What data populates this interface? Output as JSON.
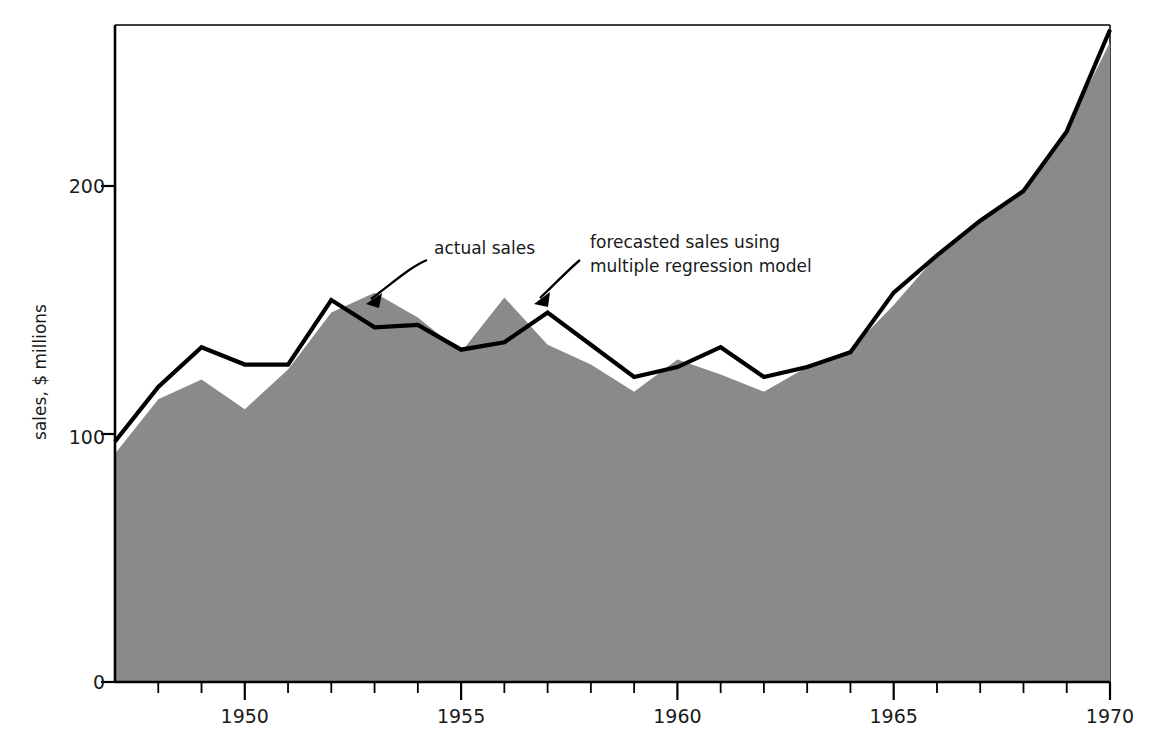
{
  "chart_data": {
    "type": "area",
    "title": "",
    "xlabel": "",
    "ylabel": "sales, $ millions",
    "xlim": [
      1947,
      1970
    ],
    "ylim": [
      0,
      265
    ],
    "grid": false,
    "legend_position": "annotations-inline",
    "x": [
      1947,
      1948,
      1949,
      1950,
      1951,
      1952,
      1953,
      1954,
      1955,
      1956,
      1957,
      1958,
      1959,
      1960,
      1961,
      1962,
      1963,
      1964,
      1965,
      1966,
      1967,
      1968,
      1969,
      1970
    ],
    "xticks": [
      1947,
      1948,
      1949,
      1950,
      1951,
      1952,
      1953,
      1954,
      1955,
      1956,
      1957,
      1958,
      1959,
      1960,
      1961,
      1962,
      1963,
      1964,
      1965,
      1966,
      1967,
      1968,
      1969,
      1970
    ],
    "xtick_labels": [
      "",
      "",
      "",
      "1950",
      "",
      "",
      "",
      "",
      "1955",
      "",
      "",
      "",
      "",
      "1960",
      "",
      "",
      "",
      "",
      "1965",
      "",
      "",
      "",
      "",
      "1970"
    ],
    "yticks": [
      0,
      100,
      200
    ],
    "ytick_labels": [
      "0",
      "100",
      "200"
    ],
    "series": [
      {
        "name": "actual sales",
        "style": "filled-area",
        "color": "#8a8a8a",
        "values": [
          92,
          114,
          122,
          110,
          126,
          149,
          157,
          147,
          133,
          155,
          136,
          128,
          117,
          130,
          124,
          117,
          127,
          134,
          152,
          172,
          186,
          198,
          223,
          258
        ]
      },
      {
        "name": "forecasted sales using multiple regression model",
        "style": "line",
        "color": "#000000",
        "values": [
          97,
          119,
          135,
          128,
          128,
          154,
          143,
          144,
          134,
          137,
          149,
          136,
          123,
          127,
          135,
          123,
          127,
          133,
          157,
          172,
          186,
          198,
          222,
          263
        ]
      }
    ],
    "annotations": [
      {
        "name": "actual-sales",
        "text": "actual sales",
        "text_lines": [
          "actual sales"
        ],
        "points_to": "gray-area-peak-1953"
      },
      {
        "name": "forecasted-sales",
        "text": "forecasted sales using multiple regression model",
        "text_lines": [
          "forecasted sales using",
          "multiple regression model"
        ],
        "points_to": "black-line-peak-1957"
      }
    ]
  },
  "axis": {
    "y_title": "sales, $ millions",
    "y_labels": [
      "200",
      "100",
      "0"
    ],
    "x_labels": [
      "1950",
      "1955",
      "1960",
      "1965",
      "1970"
    ]
  },
  "annotations": {
    "actual": "actual sales",
    "forecast_line1": "forecasted sales using",
    "forecast_line2": "multiple regression model"
  },
  "colors": {
    "area_fill": "#8a8a8a",
    "line": "#000000",
    "axis": "#000000",
    "text": "#1a1a1a"
  }
}
